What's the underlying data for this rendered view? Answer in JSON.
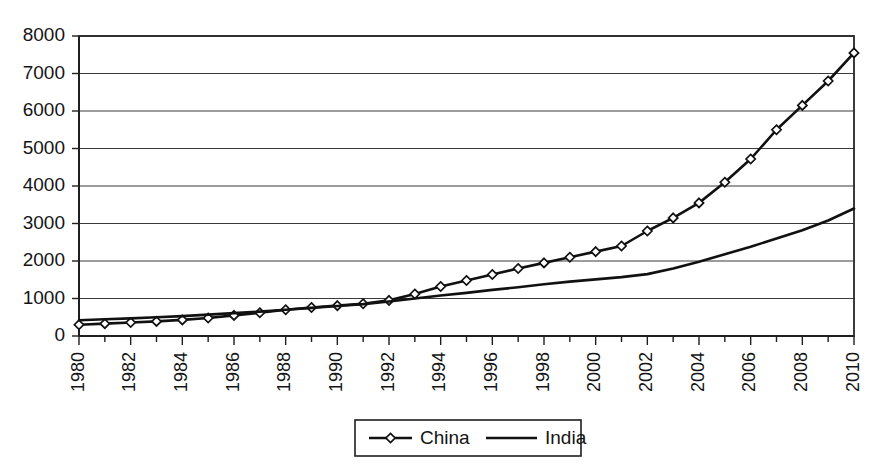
{
  "chart_data": {
    "type": "line",
    "title": "",
    "subtitle": "",
    "xlabel": "",
    "ylabel": "",
    "xlim": [
      1980,
      2010
    ],
    "ylim": [
      0,
      8000
    ],
    "grid": true,
    "legend_position": "bottom-center",
    "x": [
      1980,
      1981,
      1982,
      1983,
      1984,
      1985,
      1986,
      1987,
      1988,
      1989,
      1990,
      1991,
      1992,
      1993,
      1994,
      1995,
      1996,
      1997,
      1998,
      1999,
      2000,
      2001,
      2002,
      2003,
      2004,
      2005,
      2006,
      2007,
      2008,
      2009,
      2010
    ],
    "xtick_labels": [
      "1980",
      "1982",
      "1984",
      "1986",
      "1988",
      "1990",
      "1992",
      "1994",
      "1996",
      "1998",
      "2000",
      "2002",
      "2004",
      "2006",
      "2008",
      "2010"
    ],
    "xtick_values": [
      1980,
      1982,
      1984,
      1986,
      1988,
      1990,
      1992,
      1994,
      1996,
      1998,
      2000,
      2002,
      2004,
      2006,
      2008,
      2010
    ],
    "ytick_labels": [
      "0",
      "1000",
      "2000",
      "3000",
      "4000",
      "5000",
      "6000",
      "7000",
      "8000"
    ],
    "ytick_values": [
      0,
      1000,
      2000,
      3000,
      4000,
      5000,
      6000,
      7000,
      8000
    ],
    "series": [
      {
        "name": "China",
        "marker": "diamond",
        "color": "#111111",
        "values": [
          300,
          330,
          360,
          390,
          430,
          480,
          550,
          620,
          700,
          760,
          810,
          860,
          950,
          1120,
          1320,
          1480,
          1640,
          1800,
          1950,
          2100,
          2250,
          2400,
          2800,
          3150,
          3550,
          4100,
          4720,
          5500,
          6150,
          6800,
          7550
        ]
      },
      {
        "name": "India",
        "marker": "none",
        "color": "#111111",
        "values": [
          420,
          445,
          470,
          500,
          530,
          570,
          610,
          650,
          700,
          750,
          800,
          850,
          920,
          1000,
          1080,
          1150,
          1230,
          1300,
          1380,
          1450,
          1510,
          1570,
          1650,
          1800,
          1980,
          2180,
          2380,
          2600,
          2820,
          3080,
          3400
        ]
      }
    ]
  },
  "legend": {
    "entries": [
      {
        "label": "China",
        "marker": "diamond"
      },
      {
        "label": "India",
        "marker": "none"
      }
    ]
  }
}
